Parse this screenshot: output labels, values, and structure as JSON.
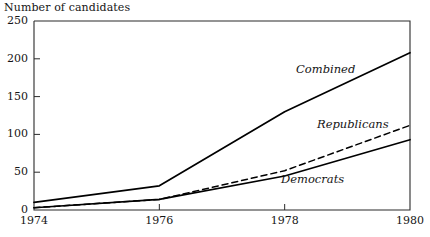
{
  "chart_data": {
    "type": "line",
    "title": "Number of candidates",
    "xlabel": "",
    "ylabel": "Number of candidates",
    "x": [
      1974,
      1976,
      1978,
      1980
    ],
    "xlim": [
      1974,
      1980
    ],
    "ylim": [
      0,
      250
    ],
    "xticks": [
      "1974",
      "1976",
      "1978",
      "1980"
    ],
    "yticks": [
      "0",
      "50",
      "100",
      "150",
      "200",
      "250"
    ],
    "grid": false,
    "legend_position": "inline-annotations",
    "series": [
      {
        "name": "Combined",
        "style": "solid",
        "color": "#000000",
        "values": [
          10,
          32,
          130,
          208
        ]
      },
      {
        "name": "Republicans",
        "style": "dashed",
        "color": "#000000",
        "values": [
          3,
          14,
          52,
          112
        ]
      },
      {
        "name": "Democrats",
        "style": "solid",
        "color": "#000000",
        "values": [
          3,
          14,
          45,
          93
        ]
      }
    ],
    "annotations": [
      {
        "text": "Combined",
        "x": 296,
        "y": 62
      },
      {
        "text": "Republicans",
        "x": 317,
        "y": 117
      },
      {
        "text": "Democrats",
        "x": 281,
        "y": 172
      }
    ]
  }
}
